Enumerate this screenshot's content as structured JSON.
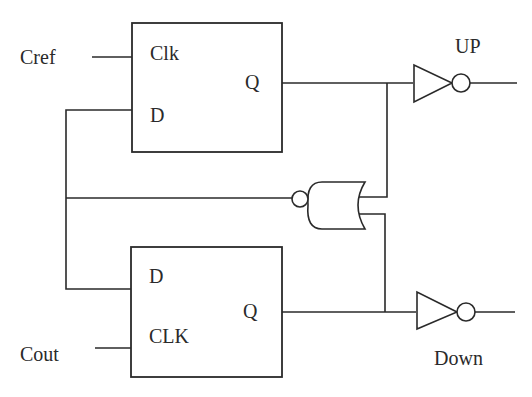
{
  "diagram": {
    "type": "phase-frequency detector logic circuit",
    "colors": {
      "stroke": "#2a2a2a",
      "background": "#ffffff"
    },
    "inputs": {
      "cref": "Cref",
      "cout": "Cout"
    },
    "outputs": {
      "up": "UP",
      "down": "Down"
    },
    "flipflop_top": {
      "clk_label": "Clk",
      "d_label": "D",
      "q_label": "Q"
    },
    "flipflop_bottom": {
      "d_label": "D",
      "clk_label": "CLK",
      "q_label": "Q"
    },
    "gates": {
      "inverter_up": "inverter-icon",
      "inverter_down": "inverter-icon",
      "reset_gate": "nor-gate-icon"
    }
  }
}
